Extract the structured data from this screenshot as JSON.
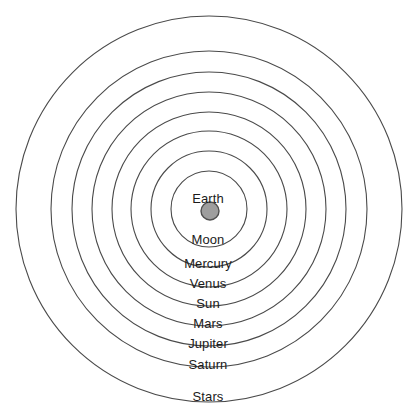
{
  "diagram": {
    "name": "geocentric-celestial-spheres",
    "background_color": "#ffffff",
    "ring_stroke_color": "#4a4a4a",
    "label_color": "#1b1b1b",
    "center": {
      "x": 209,
      "y": 209
    },
    "earth_body": {
      "label": "Earth",
      "fill_color": "#9e9e9e",
      "stroke_color": "#4f4f4f",
      "cx": 210,
      "cy": 211,
      "r": 9
    },
    "spheres": [
      {
        "label": "Moon",
        "radius": 38,
        "label_y": 233
      },
      {
        "label": "Mercury",
        "radius": 58,
        "label_y": 257
      },
      {
        "label": "Venus",
        "radius": 78,
        "label_y": 277
      },
      {
        "label": "Sun",
        "radius": 97,
        "label_y": 297
      },
      {
        "label": "Mars",
        "radius": 117,
        "label_y": 317
      },
      {
        "label": "Jupiter",
        "radius": 137,
        "label_y": 337
      },
      {
        "label": "Saturn",
        "radius": 158,
        "label_y": 358
      },
      {
        "label": "Stars",
        "radius": 193,
        "label_y": 390
      }
    ],
    "earth_label_y": 192
  },
  "chart_data": {
    "type": "diagram",
    "title": "",
    "categories": [
      "Earth",
      "Moon",
      "Mercury",
      "Venus",
      "Sun",
      "Mars",
      "Jupiter",
      "Saturn",
      "Stars"
    ],
    "values": [
      9,
      38,
      58,
      78,
      97,
      117,
      137,
      158,
      193
    ],
    "xlabel": "",
    "ylabel": "Orbital sphere radius (px)"
  }
}
